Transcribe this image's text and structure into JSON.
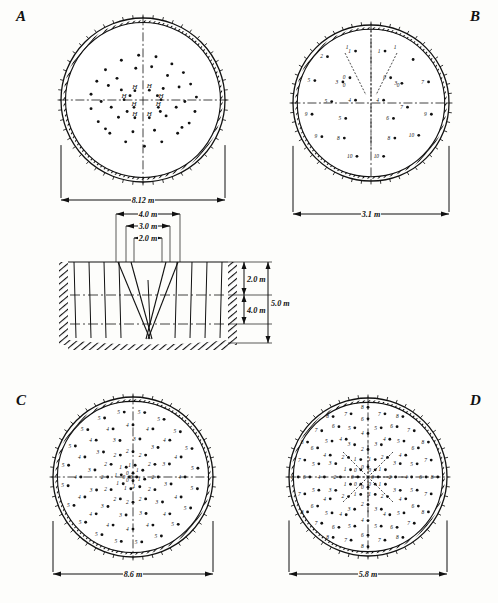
{
  "figure": {
    "panels": [
      {
        "id": "A",
        "letter": "A",
        "diameter_label": "8.12 m",
        "diameter_m": 8.12,
        "type": "tunnel-round-face",
        "hole_label": "H",
        "description": "Full-face round with H-marked cut holes"
      },
      {
        "id": "B",
        "letter": "B",
        "diameter_label": "3.1 m",
        "diameter_m": 3.1,
        "type": "tunnel-round-face",
        "description": "Small heading with angled V-cut, delay numbers 0-10"
      },
      {
        "id": "C",
        "letter": "C",
        "diameter_label": "8.6 m",
        "diameter_m": 8.6,
        "type": "tunnel-round-face",
        "description": "Large face, concentric delay rings 0-5"
      },
      {
        "id": "D",
        "letter": "D",
        "diameter_label": "5.8 m",
        "diameter_m": 5.8,
        "type": "tunnel-round-face",
        "description": "Radial eight-spoke cut, delay numbers 0-8"
      }
    ],
    "section": {
      "width_dimensions": [
        "4.0 m",
        "3.0 m",
        "2.0 m"
      ],
      "depth_dimensions": [
        "2.0 m",
        "5.0 m",
        "4.0 m"
      ],
      "top_reference": "8.12 m"
    }
  },
  "chart_data": {
    "type": "scatter",
    "xlabel": "",
    "ylabel": "",
    "panels": [
      {
        "name": "A",
        "diameter_m": 8.12,
        "dimension_label": "8.12 m",
        "marker_labels": [
          "H"
        ],
        "h_holes": [
          {
            "x": -0.18,
            "y": 0.3
          },
          {
            "x": 0.14,
            "y": 0.31
          },
          {
            "x": -0.42,
            "y": 0.1
          },
          {
            "x": 0.4,
            "y": 0.1
          },
          {
            "x": -0.2,
            "y": -0.07
          },
          {
            "x": 0.34,
            "y": -0.07
          },
          {
            "x": -0.18,
            "y": -0.3
          },
          {
            "x": 0.14,
            "y": -0.3
          }
        ],
        "dots": [
          {
            "x": -0.06,
            "y": 0.62
          },
          {
            "x": 0.18,
            "y": 0.6
          },
          {
            "x": -0.3,
            "y": 0.55
          },
          {
            "x": 0.4,
            "y": 0.5
          },
          {
            "x": -0.52,
            "y": 0.42
          },
          {
            "x": 0.56,
            "y": 0.38
          },
          {
            "x": -0.64,
            "y": 0.26
          },
          {
            "x": 0.66,
            "y": 0.22
          },
          {
            "x": -0.72,
            "y": 0.08
          },
          {
            "x": 0.74,
            "y": 0.04
          },
          {
            "x": -0.72,
            "y": -0.12
          },
          {
            "x": 0.72,
            "y": -0.16
          },
          {
            "x": -0.62,
            "y": -0.3
          },
          {
            "x": 0.64,
            "y": -0.32
          },
          {
            "x": -0.46,
            "y": -0.46
          },
          {
            "x": 0.48,
            "y": -0.46
          },
          {
            "x": -0.24,
            "y": -0.58
          },
          {
            "x": 0.26,
            "y": -0.58
          },
          {
            "x": 0.02,
            "y": -0.64
          },
          {
            "x": -0.36,
            "y": 0.3
          },
          {
            "x": 0.34,
            "y": 0.34
          },
          {
            "x": -0.48,
            "y": 0.2
          },
          {
            "x": 0.5,
            "y": 0.18
          },
          {
            "x": -0.3,
            "y": 0.14
          },
          {
            "x": 0.28,
            "y": 0.16
          },
          {
            "x": -0.44,
            "y": -0.1
          },
          {
            "x": 0.46,
            "y": -0.1
          },
          {
            "x": -0.34,
            "y": -0.24
          },
          {
            "x": 0.32,
            "y": -0.22
          },
          {
            "x": -0.14,
            "y": -0.44
          },
          {
            "x": 0.16,
            "y": -0.42
          },
          {
            "x": -0.58,
            "y": -0.02
          },
          {
            "x": 0.58,
            "y": -0.02
          },
          {
            "x": -0.1,
            "y": 0.44
          },
          {
            "x": 0.12,
            "y": 0.46
          },
          {
            "x": -0.22,
            "y": -0.16
          },
          {
            "x": 0.24,
            "y": -0.16
          },
          {
            "x": -0.52,
            "y": -0.4
          },
          {
            "x": 0.54,
            "y": -0.38
          },
          {
            "x": -0.18,
            "y": 0.06
          },
          {
            "x": 0.2,
            "y": 0.06
          }
        ]
      },
      {
        "name": "B",
        "diameter_m": 3.1,
        "dimension_label": "3.1 m",
        "delay_range": [
          0,
          10
        ],
        "holes": [
          {
            "x": -0.22,
            "y": 0.74,
            "label": "1"
          },
          {
            "x": 0.2,
            "y": 0.74,
            "label": "1"
          },
          {
            "x": -0.3,
            "y": 0.36,
            "label": "0"
          },
          {
            "x": 0.28,
            "y": 0.36,
            "label": "0"
          },
          {
            "x": -0.62,
            "y": 0.66,
            "label": "2"
          },
          {
            "x": 0.6,
            "y": 0.62,
            "label": ""
          },
          {
            "x": -0.8,
            "y": 0.32,
            "label": "5"
          },
          {
            "x": 0.82,
            "y": 0.3,
            "label": "7"
          },
          {
            "x": -0.4,
            "y": 0.3,
            "label": "3"
          },
          {
            "x": 0.44,
            "y": 0.28,
            "label": "3"
          },
          {
            "x": -0.56,
            "y": 0.02,
            "label": "5"
          },
          {
            "x": 0.52,
            "y": -0.06,
            "label": "7"
          },
          {
            "x": -0.22,
            "y": 0.04,
            "label": "4"
          },
          {
            "x": 0.18,
            "y": 0.04,
            "label": "4"
          },
          {
            "x": -0.84,
            "y": -0.16,
            "label": "9"
          },
          {
            "x": 0.86,
            "y": -0.16,
            "label": "9"
          },
          {
            "x": -0.36,
            "y": -0.22,
            "label": "5"
          },
          {
            "x": 0.32,
            "y": -0.22,
            "label": "6"
          },
          {
            "x": -0.7,
            "y": -0.48,
            "label": "9"
          },
          {
            "x": 0.68,
            "y": -0.46,
            "label": "10"
          },
          {
            "x": -0.38,
            "y": -0.5,
            "label": "8"
          },
          {
            "x": 0.34,
            "y": -0.5,
            "label": "8"
          },
          {
            "x": -0.2,
            "y": -0.76,
            "label": "10"
          },
          {
            "x": 0.18,
            "y": -0.76,
            "label": "10"
          }
        ]
      },
      {
        "name": "C",
        "diameter_m": 8.6,
        "dimension_label": "8.6 m",
        "delay_range": [
          0,
          5
        ],
        "rings": [
          {
            "delay": 0,
            "radius": 0.05,
            "count": 4
          },
          {
            "delay": 1,
            "radius": 0.16,
            "count": 8
          },
          {
            "delay": 2,
            "radius": 0.34,
            "count": 12
          },
          {
            "delay": 3,
            "radius": 0.52,
            "count": 12
          },
          {
            "delay": 4,
            "radius": 0.7,
            "count": 16
          },
          {
            "delay": 5,
            "radius": 0.88,
            "count": 20
          }
        ]
      },
      {
        "name": "D",
        "diameter_m": 5.8,
        "dimension_label": "5.8 m",
        "delay_range": [
          0,
          8
        ],
        "spokes": 8,
        "rings": [
          {
            "delay": 0,
            "radius": 0.14
          },
          {
            "delay": 1,
            "radius": 0.26
          },
          {
            "delay": 2,
            "radius": 0.38
          },
          {
            "delay": 3,
            "radius": 0.48
          },
          {
            "delay": 4,
            "radius": 0.6
          },
          {
            "delay": 5,
            "radius": 0.7
          },
          {
            "delay": 6,
            "radius": 0.8
          },
          {
            "delay": 7,
            "radius": 0.9
          },
          {
            "delay": 8,
            "radius": 0.96
          }
        ]
      }
    ],
    "section_view": {
      "widths_m": [
        4.0,
        3.0,
        2.0
      ],
      "depths_m": [
        2.0,
        4.0,
        5.0
      ],
      "labels": {
        "w1": "4.0 m",
        "w2": "3.0 m",
        "w3": "2.0 m",
        "d1": "2.0 m",
        "d2": "4.0 m",
        "d3": "5.0 m"
      }
    }
  }
}
